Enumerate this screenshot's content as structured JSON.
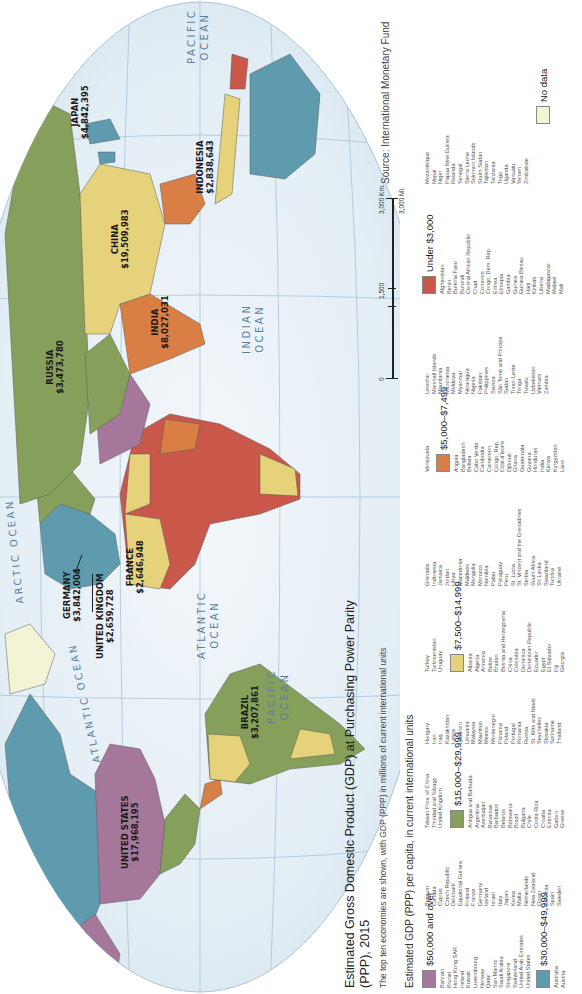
{
  "title": "Estimated Gross Domestic Product (GDP) at Purchasing Power Parity (PPP), 2015",
  "subtitle": "The top ten economies are shown, with GDP (PPP) in millions of current international units",
  "legend_heading": "Estimated GDP (PPP) per capita, in current international units",
  "source": "Source: International Monetary Fund",
  "oceans": {
    "pacific_east": [
      "PACIFIC",
      "OCEAN"
    ],
    "atlantic_north": "ATLANTIC OCEAN",
    "arctic": "ARCTIC OCEAN",
    "atlantic_south": [
      "ATLANTIC",
      "OCEAN"
    ],
    "indian": [
      "INDIAN",
      "OCEAN"
    ],
    "pacific_west": [
      "PACIFIC",
      "OCEAN"
    ]
  },
  "economies": [
    {
      "name": "UNITED STATES",
      "gdp": "$17,968,195"
    },
    {
      "name": "BRAZIL",
      "gdp": "$3,207,861"
    },
    {
      "name": "UNITED KINGDOM",
      "gdp": "$2,659,728"
    },
    {
      "name": "FRANCE",
      "gdp": "$2,646,948"
    },
    {
      "name": "GERMANY",
      "gdp": "$3,842,004"
    },
    {
      "name": "RUSSIA",
      "gdp": "$3,473,780"
    },
    {
      "name": "INDIA",
      "gdp": "$8,027,031"
    },
    {
      "name": "CHINA",
      "gdp": "$19,509,983"
    },
    {
      "name": "INDONESIA",
      "gdp": "$2,838,643"
    },
    {
      "name": "JAPAN",
      "gdp": "$4,842,395"
    }
  ],
  "scale": {
    "zero": "0",
    "mid": "1,500",
    "km": "3,000 Km.",
    "mi": "3,000 Mi."
  },
  "colors": {
    "c50k": "#a5779a",
    "c30k": "#5f9bae",
    "c15k": "#86a05c",
    "c7500": "#e6d27a",
    "c5000": "#d97e45",
    "c_under": "#c9574a",
    "c_nodata": "#f3f3d6",
    "ocean": "#dde9f1"
  },
  "legend": {
    "cat_50k": {
      "label": "$50,000 and over",
      "col1": [
        "Bahrain",
        "Brunei",
        "Hong Kong SAR",
        "Ireland",
        "Kuwait",
        "Luxembourg",
        "Norway",
        "Qatar",
        "San Marino",
        "Saudi Arabia",
        "Singapore",
        "Switzerland",
        "United Arab Emirates",
        "United States"
      ]
    },
    "cat_30k": {
      "label": "$30,000–$49,999",
      "col1": [
        "Australia",
        "Austria"
      ],
      "col2": [
        "Belgium",
        "Canada",
        "Cyprus",
        "Czech Republic",
        "Denmark",
        "Equatorial Guinea",
        "Finland",
        "France",
        "Germany",
        "Iceland",
        "Israel",
        "Italy",
        "Japan",
        "Korea",
        "Malta",
        "Netherlands",
        "New Zealand",
        "Oman",
        "Slovenia",
        "Spain",
        "Sweden"
      ],
      "col3": [
        "Taiwan Prov. of China",
        "Trinidad and Tobago",
        "United Kingdom"
      ]
    },
    "cat_15k": {
      "label": "$15,000–$29,999",
      "col1": [
        "Antigua and Barbuda",
        "Argentina",
        "Azerbaijan",
        "Bahamas",
        "Barbados",
        "Belarus",
        "Botswana",
        "Brazil",
        "Bulgaria",
        "Chile",
        "Costa Rica",
        "Croatia",
        "Estonia",
        "Gabon",
        "Greece"
      ],
      "col2": [
        "Hungary",
        "Iran",
        "Iraq",
        "Kazakhstan",
        "Latvia",
        "Lebanon",
        "Lithuania",
        "Malaysia",
        "Mauritius",
        "Mexico",
        "Montenegro",
        "Panama",
        "Poland",
        "Portugal",
        "Romania",
        "Russia",
        "St. Kitts and Nevis",
        "Seychelles",
        "Slovakia",
        "Suriname",
        "Thailand"
      ],
      "col3": [
        "Turkey",
        "Turkmenistan",
        "Uruguay"
      ]
    },
    "cat_7500": {
      "label": "$7,500–$14,999",
      "col1": [
        "Albania",
        "Algeria",
        "Armenia",
        "Belize",
        "Bhutan",
        "Bosnia and Herzegovina",
        "China",
        "Colombia",
        "Dominica",
        "Dominican Republic",
        "Ecuador",
        "Egypt",
        "El Salvador",
        "Fiji",
        "Georgia"
      ],
      "col2": [
        "Grenada",
        "Indonesia",
        "Jamaica",
        "Jordan",
        "Libya",
        "Macedonia",
        "Maldives",
        "Mongolia",
        "Morocco",
        "Namibia",
        "Palau",
        "Paraguay",
        "Peru",
        "St. Lucia",
        "St. Vincent and the Grenadines",
        "Serbia",
        "South Africa",
        "Sri Lanka",
        "Swaziland",
        "Tunisia",
        "Ukraine"
      ],
      "col3": [
        "Venezuela"
      ]
    },
    "cat_5000": {
      "label": "$5,000–$7,499",
      "col1": [
        "Angola",
        "Bangladesh",
        "Bolivia",
        "Cabo Verde",
        "Cambodia",
        "Cameroon",
        "Congo, Rep.",
        "Côte d'Ivoire",
        "Djibouti",
        "Ghana",
        "Guatemala",
        "Guyana",
        "Honduras",
        "India",
        "Kenya",
        "Kyrgyzstan",
        "Laos"
      ],
      "col2": [
        "Lesotho",
        "Marshall Islands",
        "Mauritania",
        "Micronesia",
        "Moldova",
        "Myanmar",
        "Nicaragua",
        "Nigeria",
        "Pakistan",
        "Philippines",
        "Samoa",
        "São Tomé and Principe",
        "Sudan",
        "Timor-Leste",
        "Tonga",
        "Tuvalu",
        "Uzbekistan",
        "Vietnam",
        "Zambia"
      ]
    },
    "cat_under": {
      "label": "Under $3,000",
      "col1": [
        "Afghanistan",
        "Benin",
        "Burkina Faso",
        "Burundi",
        "Central African Republic",
        "Chad",
        "Comoros",
        "Congo, Dem. Rep.",
        "Eritrea",
        "Ethiopia",
        "Gambia",
        "Guinea",
        "Guinea-Bissau",
        "Haiti",
        "Kiribati",
        "Liberia",
        "Madagascar",
        "Malawi",
        "Mali"
      ],
      "col2": [
        "Mozambique",
        "Nepal",
        "Niger",
        "Papua New Guinea",
        "Rwanda",
        "Senegal",
        "Sierra Leone",
        "Solomon Islands",
        "South Sudan",
        "Tajikistan",
        "Tanzania",
        "Togo",
        "Uganda",
        "Vanuatu",
        "Yemen",
        "Zimbabwe"
      ]
    },
    "cat_nodata": {
      "label": "No data"
    }
  }
}
